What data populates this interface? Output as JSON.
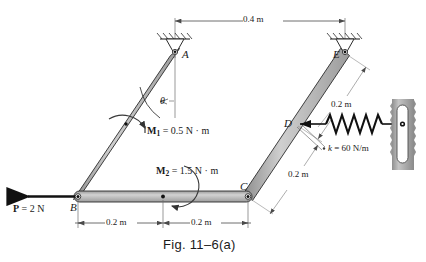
{
  "figure": {
    "caption": "Fig. 11–6(a)"
  },
  "points": {
    "A": "A",
    "B": "B",
    "C": "C",
    "D": "D",
    "E": "E"
  },
  "angle": {
    "symbol": "θ"
  },
  "loads": {
    "force_P": "P = 2 N",
    "force_P_symbol": "P",
    "force_P_value": "= 2 N",
    "moment_M1_symbol": "M",
    "moment_M1_sub": "1",
    "moment_M1_value": "= 0.5 N · m",
    "moment_M1_full": "M1 = 0.5 N · m",
    "moment_M2_symbol": "M",
    "moment_M2_sub": "2",
    "moment_M2_value": "= 1.5 N · m",
    "moment_M2_full": "M2 = 1.5 N · m"
  },
  "spring": {
    "stiffness_symbol": "k",
    "stiffness_value": "= 60 N/m",
    "stiffness_full": "k = 60 N/m"
  },
  "dimensions": {
    "top_span": "0.4 m",
    "bottom_left": "0.2 m",
    "bottom_right": "0.2 m",
    "right_upper": "0.2 m",
    "right_lower": "0.2 m"
  },
  "colors": {
    "bar_fill": "#b9b9b9",
    "bar_edge": "#2b2b2b",
    "wall_fill": "#a8a8a8",
    "line": "#4a4a4a",
    "ink": "#1a1a1a"
  },
  "geometry": {
    "A": [
      175,
      52
    ],
    "B": [
      78,
      196
    ],
    "C": [
      248,
      197
    ],
    "D": [
      297,
      124
    ],
    "E": [
      345,
      52
    ]
  }
}
